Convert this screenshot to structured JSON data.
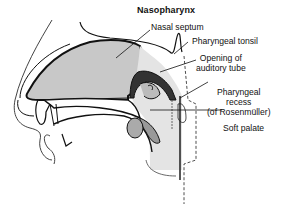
{
  "title": "Nasopharynx",
  "labels": {
    "nasal_septum": "Nasal septum",
    "pharyngeal_tonsil": "Pharyngeal tonsil",
    "opening_line1": "Opening of",
    "opening_line2": "auditory tube",
    "recess_line1": "Pharyngeal",
    "recess_line2": "recess",
    "recess_line3": "(of Rosenmüller)",
    "soft_palate": "Soft palate"
  },
  "colors": {
    "tissue_fill": "#c8c8c8",
    "tissue_light": "#e4e4e4",
    "outline": "#111111"
  }
}
